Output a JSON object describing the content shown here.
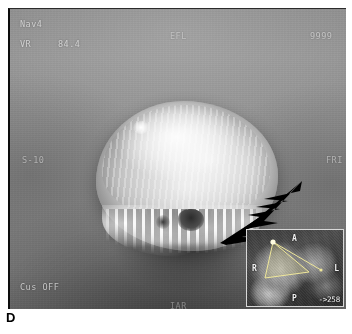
{
  "panel": {
    "letter": "D"
  },
  "osd": {
    "nav": "Nav4",
    "vr_label": "VR",
    "vr_value": "84.4",
    "top_center": "EFL",
    "top_right": "9999",
    "left_edge": "S-10",
    "right_edge": "FRI",
    "bottom_left": "Cus OFF",
    "bottom_center": "IAR"
  },
  "arrow": {
    "name": "annotation-arrow",
    "color": "#000000",
    "points_to": "lesion-inferior-margin"
  },
  "inset": {
    "orientation": {
      "anterior": "A",
      "right": "R",
      "left": "L",
      "posterior": "P"
    },
    "readout": "->258"
  },
  "colors": {
    "frame_background": "#8a8a8a",
    "overlay_text": "#e9e9e9",
    "inset_border": "#d8d8d8",
    "page_background": "#ffffff"
  }
}
